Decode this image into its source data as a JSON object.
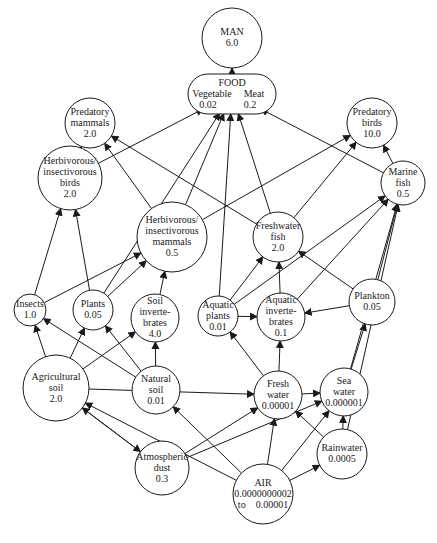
{
  "diagram": {
    "nodes": [
      {
        "id": "man",
        "lines": [
          "MAN",
          "6.0"
        ]
      },
      {
        "id": "food",
        "lines": [
          "FOOD"
        ],
        "sub": [
          {
            "label": "Vegetable",
            "value": "0.02"
          },
          {
            "label": "Meat",
            "value": "0.2"
          }
        ]
      },
      {
        "id": "predatory_mammals",
        "lines": [
          "Predatory",
          "mammals",
          "2.0"
        ]
      },
      {
        "id": "predatory_birds",
        "lines": [
          "Predatory",
          "birds",
          "10.0"
        ]
      },
      {
        "id": "herb_birds",
        "lines": [
          "Herbivorous/",
          "insectivorous",
          "birds",
          "2.0"
        ]
      },
      {
        "id": "marine_fish",
        "lines": [
          "Marine",
          "fish",
          "0.5"
        ]
      },
      {
        "id": "herb_mammals",
        "lines": [
          "Herbivorous/",
          "insectivorous",
          "mammals",
          "0.5"
        ]
      },
      {
        "id": "freshwater_fish",
        "lines": [
          "Freshwater",
          "fish",
          "2.0"
        ]
      },
      {
        "id": "insects",
        "lines": [
          "Insects",
          "1.0"
        ]
      },
      {
        "id": "plants",
        "lines": [
          "Plants",
          "0.05"
        ]
      },
      {
        "id": "soil_inv",
        "lines": [
          "Soil",
          "inverte-",
          "brates",
          "4.0"
        ]
      },
      {
        "id": "aquatic_plants",
        "lines": [
          "Aquatic",
          "plants",
          "0.01"
        ]
      },
      {
        "id": "aquatic_inv",
        "lines": [
          "Aquatic",
          "inverte-",
          "brates",
          "0.1"
        ]
      },
      {
        "id": "plankton",
        "lines": [
          "Plankton",
          "0.05"
        ]
      },
      {
        "id": "agri_soil",
        "lines": [
          "Agricultural",
          "soil",
          "2.0"
        ]
      },
      {
        "id": "natural_soil",
        "lines": [
          "Natural",
          "soil",
          "0.01"
        ]
      },
      {
        "id": "fresh_water",
        "lines": [
          "Fresh",
          "water",
          "0.00001"
        ]
      },
      {
        "id": "sea_water",
        "lines": [
          "Sea",
          "water",
          "0.000001"
        ]
      },
      {
        "id": "atm_dust",
        "lines": [
          "Atmospheric",
          "dust",
          "0.3"
        ]
      },
      {
        "id": "rainwater",
        "lines": [
          "Rainwater",
          "0.0005"
        ]
      },
      {
        "id": "air",
        "lines": [
          "AIR",
          "0.0000000002",
          "to    0.00001"
        ]
      }
    ],
    "edges": [
      [
        "food",
        "man"
      ],
      [
        "herb_birds",
        "predatory_mammals"
      ],
      [
        "herb_mammals",
        "predatory_mammals"
      ],
      [
        "freshwater_fish",
        "predatory_mammals"
      ],
      [
        "herb_birds",
        "food"
      ],
      [
        "herb_mammals",
        "food"
      ],
      [
        "plants",
        "food"
      ],
      [
        "freshwater_fish",
        "food"
      ],
      [
        "marine_fish",
        "food"
      ],
      [
        "aquatic_plants",
        "food"
      ],
      [
        "marine_fish",
        "predatory_birds"
      ],
      [
        "freshwater_fish",
        "predatory_birds"
      ],
      [
        "herb_mammals",
        "predatory_birds"
      ],
      [
        "insects",
        "herb_birds"
      ],
      [
        "plants",
        "herb_birds"
      ],
      [
        "plants",
        "herb_mammals"
      ],
      [
        "insects",
        "herb_mammals"
      ],
      [
        "soil_inv",
        "herb_mammals"
      ],
      [
        "aquatic_plants",
        "freshwater_fish"
      ],
      [
        "aquatic_inv",
        "freshwater_fish"
      ],
      [
        "plankton",
        "freshwater_fish"
      ],
      [
        "aquatic_plants",
        "marine_fish"
      ],
      [
        "aquatic_inv",
        "marine_fish"
      ],
      [
        "plankton",
        "marine_fish"
      ],
      [
        "sea_water",
        "marine_fish"
      ],
      [
        "rainwater",
        "marine_fish"
      ],
      [
        "aquatic_plants",
        "aquatic_inv"
      ],
      [
        "plankton",
        "aquatic_inv"
      ],
      [
        "agri_soil",
        "insects"
      ],
      [
        "natural_soil",
        "insects"
      ],
      [
        "agri_soil",
        "plants"
      ],
      [
        "natural_soil",
        "plants"
      ],
      [
        "agri_soil",
        "soil_inv"
      ],
      [
        "natural_soil",
        "soil_inv"
      ],
      [
        "fresh_water",
        "aquatic_plants"
      ],
      [
        "fresh_water",
        "aquatic_inv"
      ],
      [
        "sea_water",
        "plankton"
      ],
      [
        "fresh_water",
        "sea_water"
      ],
      [
        "agri_soil",
        "atm_dust"
      ],
      [
        "atm_dust",
        "agri_soil"
      ],
      [
        "agri_soil",
        "fresh_water"
      ],
      [
        "atm_dust",
        "fresh_water"
      ],
      [
        "atm_dust",
        "sea_water"
      ],
      [
        "air",
        "agri_soil"
      ],
      [
        "air",
        "natural_soil"
      ],
      [
        "air",
        "fresh_water"
      ],
      [
        "air",
        "sea_water"
      ],
      [
        "air",
        "rainwater"
      ],
      [
        "rainwater",
        "fresh_water"
      ],
      [
        "rainwater",
        "sea_water"
      ]
    ]
  }
}
